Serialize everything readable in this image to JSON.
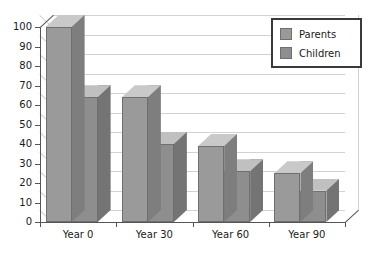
{
  "chart_data": {
    "type": "bar",
    "title": "",
    "xlabel": "",
    "ylabel": "",
    "categories": [
      "Year 0",
      "Year 30",
      "Year 60",
      "Year 90"
    ],
    "series": [
      {
        "name": "Parents",
        "values": [
          100,
          64,
          39,
          25
        ]
      },
      {
        "name": "Children",
        "values": [
          64,
          40,
          26,
          16
        ]
      }
    ],
    "ylim": [
      0,
      100
    ],
    "ytick_step": 10,
    "yticks": [
      0,
      10,
      20,
      30,
      40,
      50,
      60,
      70,
      80,
      90,
      100
    ],
    "ytick_labels": [
      "0",
      "10",
      "20",
      "30",
      "40",
      "50",
      "60",
      "70",
      "80",
      "90",
      "100"
    ],
    "grid": true,
    "legend_position": "top-right",
    "three_d": true
  },
  "legend": {
    "items": [
      {
        "label": "Parents",
        "color": "#9a9a9a"
      },
      {
        "label": "Children",
        "color": "#8e8e8e"
      }
    ]
  },
  "colors": {
    "parents_front": "#9a9a9a",
    "parents_top": "#c9c9c9",
    "parents_side": "#7e7e7e",
    "children_front": "#8e8e8e",
    "children_top": "#c0c0c0",
    "children_side": "#747474",
    "gridline": "#d2d2d2",
    "axis": "#555555",
    "background": "#ffffff",
    "text": "#1a1a1a"
  }
}
